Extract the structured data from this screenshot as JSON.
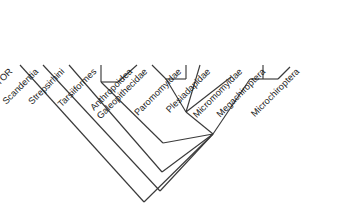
{
  "figure": {
    "type": "cladogram",
    "title": "",
    "background_color": "#ffffff",
    "line_color": "#3a3a3a",
    "text_color": "#1c1c1c",
    "label_rotation_deg": -45
  },
  "taxa": [
    {
      "id": "ancestor",
      "label": "ANCESTOR",
      "tip_x": 58,
      "tip_y": 198,
      "label_x": 40,
      "label_y": 176
    },
    {
      "id": "scandentia",
      "label": "Scandentia",
      "tip_x": 130,
      "tip_y": 196,
      "label_x": 122,
      "label_y": 176
    },
    {
      "id": "strepsirhini",
      "label": "Strepsirhini",
      "tip_x": 207,
      "tip_y": 196,
      "label_x": 198,
      "label_y": 176
    },
    {
      "id": "tarsiiformes",
      "label": "Tarsiiformes",
      "tip_x": 302,
      "tip_y": 196,
      "label_x": 277,
      "label_y": 176
    },
    {
      "id": "anthropoidea",
      "label": "Anthropoidea",
      "tip_x": 358,
      "tip_y": 196,
      "label_x": 358,
      "label_y": 176
    },
    {
      "id": "galeopithecidae",
      "label": "Galeopithecidae",
      "tip_x": 452,
      "tip_y": 196,
      "label_x": 440,
      "label_y": 176
    },
    {
      "id": "paromomyidae",
      "label": "Paromomyidae",
      "tip_x": 503,
      "tip_y": 196,
      "label_x": 508,
      "label_y": 176
    },
    {
      "id": "plesiadapidae",
      "label": "Plesiadapidae",
      "tip_x": 590,
      "tip_y": 196,
      "label_x": 586,
      "label_y": 176
    },
    {
      "id": "micromomyidae",
      "label": "Micromomyidae",
      "tip_x": 672,
      "tip_y": 196,
      "label_x": 666,
      "label_y": 176
    },
    {
      "id": "megachiroptera",
      "label": "Megachiroptera",
      "tip_x": 770,
      "tip_y": 196,
      "label_x": 742,
      "label_y": 176
    },
    {
      "id": "microchiroptera",
      "label": "Microchiroptera",
      "tip_x": 823,
      "tip_y": 196,
      "label_x": 818,
      "label_y": 176
    }
  ],
  "topology": {
    "root_node": "node-root",
    "description": "Diagonal ladder cladogram. Successive outgroups ANCESTOR, Scandentia, Strepsirhini branch off a descending spine; Tarsiiformes + Anthropoidea form a clade; Galeopithecidae + Paromomyidae pair joins a polytomy with Plesiadapidae and Micromomyidae; Megachiroptera + Microchiroptera form the bat clade.",
    "clades": [
      {
        "id": "clade-tarsii-anthro",
        "members": [
          "tarsiiformes",
          "anthropoidea"
        ]
      },
      {
        "id": "clade-galeo-paromo",
        "members": [
          "galeopithecidae",
          "paromomyidae"
        ]
      },
      {
        "id": "polytomy-archonta",
        "members": [
          "clade-galeo-paromo",
          "plesiadapidae",
          "micromomyidae"
        ]
      },
      {
        "id": "clade-chiroptera",
        "members": [
          "megachiroptera",
          "microchiroptera"
        ]
      }
    ]
  }
}
